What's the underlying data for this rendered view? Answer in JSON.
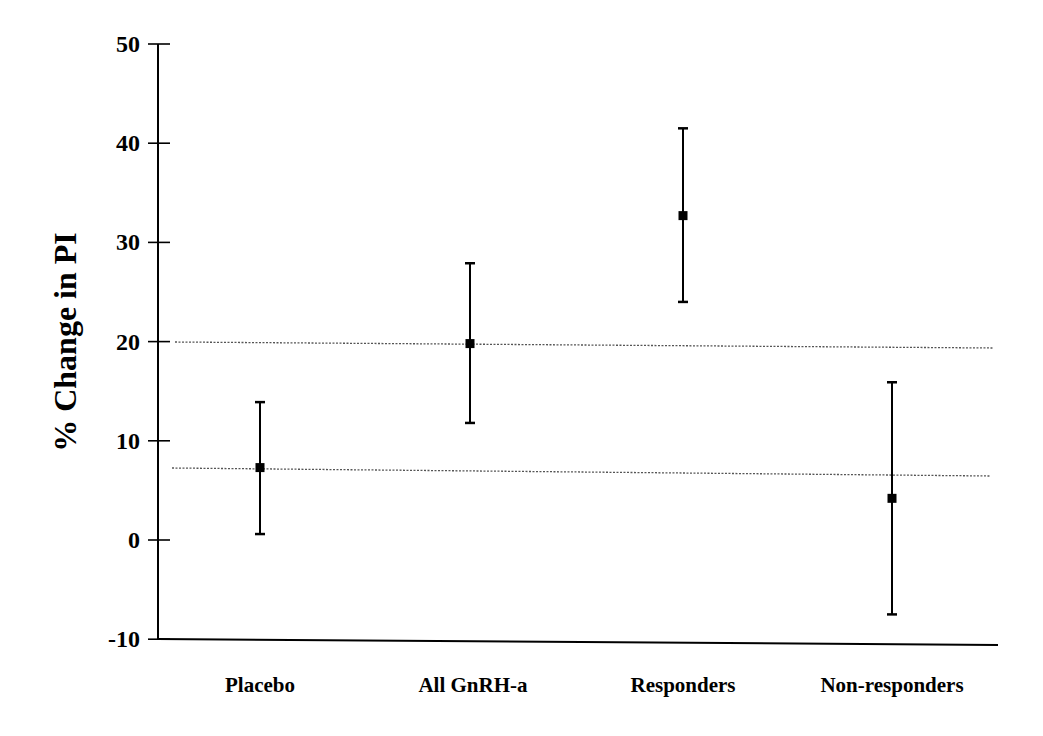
{
  "chart_data": {
    "type": "errorbar",
    "title": "",
    "xlabel": "",
    "ylabel": "% Change in PI",
    "ylim": [
      -10,
      50
    ],
    "yticks": [
      -10,
      0,
      10,
      20,
      30,
      40,
      50
    ],
    "ytick_labels": [
      "-10",
      "0",
      "10",
      "20",
      "30",
      "40",
      "50"
    ],
    "grid": false,
    "legend": null,
    "categories": [
      "Placebo",
      "All GnRH-a",
      "Responders",
      "Non-responders"
    ],
    "series": [
      {
        "name": "% Change in PI",
        "marker": "square",
        "values": [
          7.3,
          19.8,
          32.7,
          4.2
        ],
        "upper": [
          13.9,
          27.9,
          41.5,
          15.9
        ],
        "lower": [
          0.6,
          11.8,
          24.0,
          -7.5
        ]
      }
    ],
    "reference_lines": [
      {
        "y": 20,
        "style": "dotted"
      },
      {
        "y": 7.2,
        "style": "dotted"
      }
    ]
  },
  "colors": {
    "axis": "#000000",
    "marker": "#000000",
    "reference_line": "#555555",
    "background": "#ffffff"
  }
}
